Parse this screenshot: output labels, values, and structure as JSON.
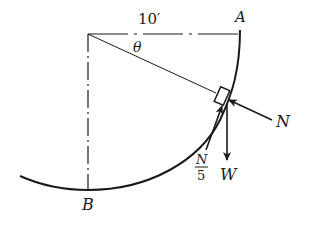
{
  "figure": {
    "type": "free-body diagram",
    "labels": {
      "radius": "10′",
      "angle": "θ",
      "point_top": "A",
      "point_bottom": "B",
      "normal_force": "N",
      "weight": "W",
      "friction_numerator": "N",
      "friction_denominator": "5"
    },
    "colors": {
      "ink": "#1a1a1a",
      "background": "#ffffff"
    }
  }
}
